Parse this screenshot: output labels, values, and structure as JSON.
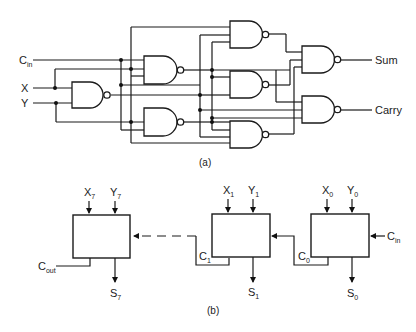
{
  "figure": {
    "part_a": {
      "caption": "(a)",
      "inputs": {
        "cin": {
          "base": "C",
          "sub": "in"
        },
        "x": {
          "label": "X"
        },
        "y": {
          "label": "Y"
        }
      },
      "outputs": {
        "sum": {
          "label": "Sum"
        },
        "carry": {
          "label": "Carry"
        }
      },
      "gate_type": "NAND",
      "gate_count": 8
    },
    "part_b": {
      "caption": "(b)",
      "blocks": [
        {
          "name": "stage-7",
          "x_in": {
            "base": "X",
            "sub": "7"
          },
          "y_in": {
            "base": "Y",
            "sub": "7"
          },
          "sum_out": {
            "base": "S",
            "sub": "7"
          },
          "carry_out": {
            "base": "C",
            "sub": "out"
          }
        },
        {
          "name": "stage-1",
          "x_in": {
            "base": "X",
            "sub": "1"
          },
          "y_in": {
            "base": "Y",
            "sub": "1"
          },
          "sum_out": {
            "base": "S",
            "sub": "1"
          },
          "carry_out": {
            "base": "C",
            "sub": "1"
          }
        },
        {
          "name": "stage-0",
          "x_in": {
            "base": "X",
            "sub": "0"
          },
          "y_in": {
            "base": "Y",
            "sub": "0"
          },
          "sum_out": {
            "base": "S",
            "sub": "0"
          },
          "carry_out": {
            "base": "C",
            "sub": "0"
          },
          "carry_in": {
            "base": "C",
            "sub": "in"
          }
        }
      ]
    }
  }
}
